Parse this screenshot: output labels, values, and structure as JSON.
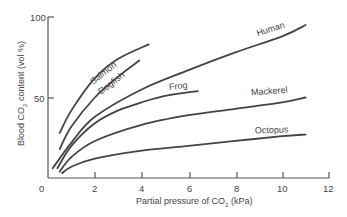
{
  "chart_data": {
    "type": "line",
    "title": "",
    "xlabel": "Partial pressure of CO2 (kPa)",
    "ylabel": "Blood CO2 content (vol %)",
    "xlim": [
      0,
      12
    ],
    "ylim": [
      0,
      100
    ],
    "x_ticks": [
      "0",
      "2",
      "4",
      "6",
      "8",
      "10",
      "12"
    ],
    "y_ticks": [
      "0",
      "50",
      "100"
    ],
    "grid": false,
    "legend": "inline labels on curves",
    "series": [
      {
        "name": "Salmon",
        "x": [
          0.5,
          1,
          2,
          3,
          4.3
        ],
        "y": [
          28,
          42,
          62,
          74,
          83
        ]
      },
      {
        "name": "Dogfish",
        "x": [
          0.5,
          1,
          2,
          3,
          3.9
        ],
        "y": [
          18,
          32,
          50,
          63,
          73
        ]
      },
      {
        "name": "Human",
        "x": [
          0.2,
          1,
          2,
          4,
          6,
          8,
          10,
          11
        ],
        "y": [
          6,
          22,
          38,
          55,
          67,
          78,
          88,
          95
        ]
      },
      {
        "name": "Frog",
        "x": [
          0.4,
          1,
          2,
          3,
          4,
          5,
          6.4
        ],
        "y": [
          6,
          20,
          34,
          42,
          47,
          51,
          54
        ]
      },
      {
        "name": "Mackerel",
        "x": [
          0.5,
          1,
          2,
          4,
          6,
          8,
          10,
          11
        ],
        "y": [
          4,
          13,
          23,
          33,
          39,
          43,
          47,
          50
        ]
      },
      {
        "name": "Octopus",
        "x": [
          0.6,
          1,
          2,
          4,
          6,
          8,
          10,
          11
        ],
        "y": [
          3,
          7,
          12,
          17,
          20,
          23,
          26,
          27
        ]
      }
    ]
  },
  "labels": {
    "xlabel_main": "Partial pressure of CO",
    "xlabel_sub": "2",
    "xlabel_end": " (kPa)",
    "ylabel_main": "Blood CO",
    "ylabel_sub": "2",
    "ylabel_end": " content (vol %)",
    "salmon": "Salmon",
    "dogfish": "Dogfish",
    "human": "Human",
    "frog": "Frog",
    "mackerel": "Mackerel",
    "octopus": "Octopus"
  }
}
